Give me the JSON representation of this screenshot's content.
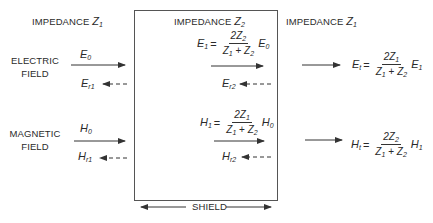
{
  "regions": {
    "left": {
      "label": "IMPEDANCE",
      "symbol": "Z",
      "sub": "1"
    },
    "center": {
      "label": "IMPEDANCE",
      "symbol": "Z",
      "sub": "2"
    },
    "right": {
      "label": "IMPEDANCE",
      "symbol": "Z",
      "sub": "1"
    }
  },
  "fields": {
    "electric": {
      "label_line1": "ELECTRIC",
      "label_line2": "FIELD",
      "incident": {
        "symbol": "E",
        "sub": "0"
      },
      "reflected_outer": {
        "symbol": "E",
        "sub": "r1"
      },
      "reflected_inner": {
        "symbol": "E",
        "sub": "r2"
      },
      "inner_eq": {
        "lhs": "E",
        "lhs_sub": "1",
        "num": "2Z",
        "num_sub": "2",
        "den_a": "Z",
        "den_a_sub": "1",
        "den_op": " + ",
        "den_b": "Z",
        "den_b_sub": "2",
        "rhs": "E",
        "rhs_sub": "0"
      },
      "transmitted_eq": {
        "lhs": "E",
        "lhs_sub": "t",
        "num": "2Z",
        "num_sub": "1",
        "den_a": "Z",
        "den_a_sub": "1",
        "den_op": " + ",
        "den_b": "Z",
        "den_b_sub": "2",
        "rhs": "E",
        "rhs_sub": "1"
      }
    },
    "magnetic": {
      "label_line1": "MAGNETIC",
      "label_line2": "FIELD",
      "incident": {
        "symbol": "H",
        "sub": "0"
      },
      "reflected_outer": {
        "symbol": "H",
        "sub": "r1"
      },
      "reflected_inner": {
        "symbol": "H",
        "sub": "r2"
      },
      "inner_eq": {
        "lhs": "H",
        "lhs_sub": "1",
        "num": "2Z",
        "num_sub": "1",
        "den_a": "Z",
        "den_a_sub": "1",
        "den_op": " + ",
        "den_b": "Z",
        "den_b_sub": "2",
        "rhs": "H",
        "rhs_sub": "0"
      },
      "transmitted_eq": {
        "lhs": "H",
        "lhs_sub": "t",
        "num": "2Z",
        "num_sub": "2",
        "den_a": "Z",
        "den_a_sub": "1",
        "den_op": " + ",
        "den_b": "Z",
        "den_b_sub": "2",
        "rhs": "H",
        "rhs_sub": "1"
      }
    }
  },
  "shield": {
    "label": "SHIELD"
  },
  "equals": "="
}
